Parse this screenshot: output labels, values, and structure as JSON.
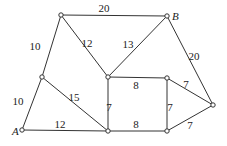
{
  "diagram": {
    "type": "weighted-graph",
    "nodes": [
      {
        "id": "n1",
        "label": "",
        "x": 61,
        "y": 15
      },
      {
        "id": "B",
        "label": "B",
        "x": 167,
        "y": 16
      },
      {
        "id": "n2",
        "label": "",
        "x": 42,
        "y": 77
      },
      {
        "id": "A",
        "label": "A",
        "x": 22,
        "y": 130
      },
      {
        "id": "n3",
        "label": "",
        "x": 108,
        "y": 77
      },
      {
        "id": "n4",
        "label": "",
        "x": 167,
        "y": 78
      },
      {
        "id": "n5",
        "label": "",
        "x": 213,
        "y": 105
      },
      {
        "id": "n6",
        "label": "",
        "x": 108,
        "y": 131
      },
      {
        "id": "n7",
        "label": "",
        "x": 167,
        "y": 131
      }
    ],
    "edges": [
      {
        "from": "n1",
        "to": "B",
        "weight": "20",
        "lx": 104,
        "ly": 12
      },
      {
        "from": "n1",
        "to": "n2",
        "weight": "10",
        "lx": 35,
        "ly": 50
      },
      {
        "from": "n2",
        "to": "A",
        "weight": "10",
        "lx": 18,
        "ly": 105
      },
      {
        "from": "n1",
        "to": "n3",
        "weight": "12",
        "lx": 87,
        "ly": 47
      },
      {
        "from": "B",
        "to": "n3",
        "weight": "13",
        "lx": 128,
        "ly": 48
      },
      {
        "from": "B",
        "to": "n5",
        "weight": "20",
        "lx": 194,
        "ly": 60
      },
      {
        "from": "n2",
        "to": "n6",
        "weight": "15",
        "lx": 74,
        "ly": 101
      },
      {
        "from": "A",
        "to": "n6",
        "weight": "12",
        "lx": 60,
        "ly": 128
      },
      {
        "from": "n3",
        "to": "n4",
        "weight": "8",
        "lx": 136,
        "ly": 89
      },
      {
        "from": "n3",
        "to": "n6",
        "weight": "7",
        "lx": 109,
        "ly": 111
      },
      {
        "from": "n4",
        "to": "n7",
        "weight": "7",
        "lx": 170,
        "ly": 111
      },
      {
        "from": "n4",
        "to": "n5",
        "weight": "7",
        "lx": 186,
        "ly": 88
      },
      {
        "from": "n6",
        "to": "n7",
        "weight": "8",
        "lx": 136,
        "ly": 128
      },
      {
        "from": "n7",
        "to": "n5",
        "weight": "7",
        "lx": 190,
        "ly": 129
      }
    ]
  }
}
